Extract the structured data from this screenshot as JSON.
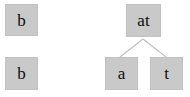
{
  "diagram": {
    "background_color": "#ffffff",
    "node_fill_color": "#c9c9c9",
    "node_border_color": "#c2c2c2",
    "node_text_color": "#0d0d0d",
    "edge_color": "#c0c0c0",
    "left_group": {
      "name": "standalone-nodes",
      "nodes": [
        {
          "id": "left-top",
          "label": "b",
          "x": 5,
          "y": 4,
          "w": 33,
          "h": 32
        },
        {
          "id": "left-bottom",
          "label": "b",
          "x": 5,
          "y": 57,
          "w": 33,
          "h": 33
        }
      ]
    },
    "right_group": {
      "name": "binary-tree",
      "nodes": [
        {
          "id": "root",
          "label": "at",
          "x": 126,
          "y": 4,
          "w": 35,
          "h": 33
        },
        {
          "id": "child-left",
          "label": "a",
          "x": 105,
          "y": 57,
          "w": 33,
          "h": 33
        },
        {
          "id": "child-right",
          "label": "t",
          "x": 150,
          "y": 57,
          "w": 33,
          "h": 33
        }
      ],
      "edges": [
        {
          "id": "edge-root-left",
          "from": "root",
          "to": "child-left",
          "x1": 143,
          "y1": 39,
          "x2": 120,
          "y2": 57
        },
        {
          "id": "edge-root-right",
          "from": "root",
          "to": "child-right",
          "x1": 143,
          "y1": 39,
          "x2": 166,
          "y2": 57
        }
      ]
    }
  }
}
